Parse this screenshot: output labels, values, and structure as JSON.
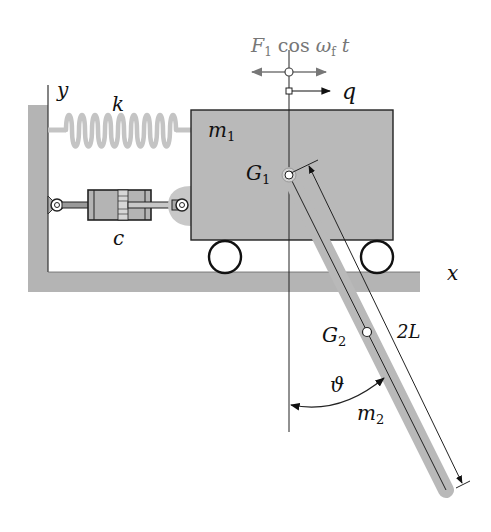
{
  "figure": {
    "colors": {
      "background": "#ffffff",
      "ground": "#b4b4b4",
      "cart_fill": "#b9b9b9",
      "rod_fill": "#b9b9b9",
      "spring": "#c4c4c4",
      "stroke": "#111111",
      "force_label": "#7a7a7a"
    }
  },
  "labels": {
    "force": {
      "F": "F",
      "sub": "1",
      "cos": " cos ",
      "omega": "ω",
      "omega_sub": "f",
      "t": " t"
    },
    "q": "q",
    "y_axis": "y",
    "x_axis": "x",
    "spring": "k",
    "damper": "c",
    "cart_mass": {
      "m": "m",
      "sub": "1"
    },
    "G1": {
      "G": "G",
      "sub": "1"
    },
    "G2": {
      "G": "G",
      "sub": "2"
    },
    "rod_length": "2L",
    "angle": "ϑ",
    "rod_mass": {
      "m": "m",
      "sub": "2"
    }
  },
  "geometry": {
    "cart": {
      "x": 191,
      "y": 110,
      "width": 202,
      "height": 130
    },
    "wheels": [
      {
        "cx": 225,
        "cy": 257,
        "r": 16
      },
      {
        "cx": 377,
        "cy": 257,
        "r": 16
      }
    ],
    "pivot_G1": {
      "x": 289,
      "y": 175
    },
    "center_G2": {
      "x": 367,
      "y": 332
    },
    "rod_end": {
      "x": 446,
      "y": 490
    }
  }
}
